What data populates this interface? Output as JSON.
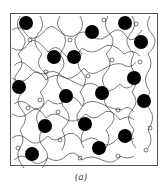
{
  "figure": {
    "caption": "(a)",
    "frame": {
      "x": 10,
      "y": 13,
      "width": 147,
      "height": 152,
      "stroke": "#555555"
    },
    "particle_color": "#000000",
    "chain_color": "#222222",
    "particle_radius": 7,
    "particles": [
      {
        "cx": 26,
        "cy": 23
      },
      {
        "cx": 92,
        "cy": 32
      },
      {
        "cx": 125,
        "cy": 23
      },
      {
        "cx": 141,
        "cy": 42
      },
      {
        "cx": 54,
        "cy": 57
      },
      {
        "cx": 74,
        "cy": 57
      },
      {
        "cx": 134,
        "cy": 78
      },
      {
        "cx": 19,
        "cy": 87
      },
      {
        "cx": 66,
        "cy": 96
      },
      {
        "cx": 102,
        "cy": 93
      },
      {
        "cx": 144,
        "cy": 101
      },
      {
        "cx": 45,
        "cy": 126
      },
      {
        "cx": 85,
        "cy": 124
      },
      {
        "cx": 125,
        "cy": 136
      },
      {
        "cx": 32,
        "cy": 154
      },
      {
        "cx": 99,
        "cy": 148
      }
    ]
  }
}
